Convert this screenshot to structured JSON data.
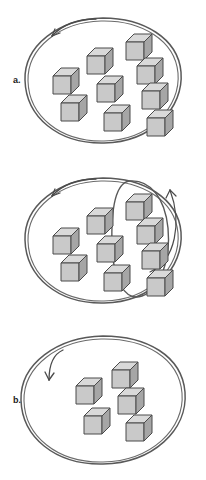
{
  "figure": {
    "background_color": "#ffffff",
    "outline_color": "#4d4d4d",
    "label_color": "#1a1a1a"
  },
  "cube_style": {
    "top_face_color": "#d8d8d8",
    "front_face_color": "#c9c9c9",
    "side_face_color": "#a8a8a8",
    "edge_color": "#4a4a4a"
  },
  "panels": [
    {
      "id": "a",
      "label": "a.",
      "enclosure": "hand-drawn-rounded-circle",
      "arrow": "curved-arrow-top-left-pointing-into-enclosure",
      "cube_count": 9,
      "inner_enclosure": false,
      "cubes": [
        {
          "x": 126,
          "y": 34,
          "size": 26
        },
        {
          "x": 87,
          "y": 48,
          "size": 25
        },
        {
          "x": 137,
          "y": 58,
          "size": 25
        },
        {
          "x": 53,
          "y": 68,
          "size": 25
        },
        {
          "x": 97,
          "y": 76,
          "size": 26
        },
        {
          "x": 142,
          "y": 83,
          "size": 25
        },
        {
          "x": 61,
          "y": 95,
          "size": 25
        },
        {
          "x": 104,
          "y": 105,
          "size": 26
        },
        {
          "x": 147,
          "y": 110,
          "size": 25
        }
      ]
    },
    {
      "id": "b",
      "label": "b.",
      "enclosure": "hand-drawn-rounded-circle",
      "arrow": "curved-arrow-top-left-pointing-into-enclosure",
      "inner_enclosure": true,
      "inner_enclosure_shape": "tilted-ellipse-right-side",
      "inner_arrow": "curved-arrow-pointing-up-right-from-inner-ellipse",
      "cube_count": 9,
      "cubes_inside_inner": 4,
      "cubes_outside_inner": 5,
      "cubes": [
        {
          "x": 126,
          "y": 34,
          "size": 26,
          "in_inner": true
        },
        {
          "x": 87,
          "y": 48,
          "size": 25,
          "in_inner": false
        },
        {
          "x": 137,
          "y": 58,
          "size": 25,
          "in_inner": true
        },
        {
          "x": 53,
          "y": 68,
          "size": 25,
          "in_inner": false
        },
        {
          "x": 97,
          "y": 76,
          "size": 26,
          "in_inner": false
        },
        {
          "x": 142,
          "y": 83,
          "size": 25,
          "in_inner": true
        },
        {
          "x": 61,
          "y": 95,
          "size": 25,
          "in_inner": false
        },
        {
          "x": 104,
          "y": 105,
          "size": 26,
          "in_inner": false
        },
        {
          "x": 147,
          "y": 110,
          "size": 25,
          "in_inner": true
        }
      ]
    },
    {
      "id": "c",
      "label": "c.",
      "enclosure": "hand-drawn-rounded-circle",
      "arrow": "curved-arrow-left-pointing-into-enclosure",
      "inner_enclosure": false,
      "cube_count": 5,
      "cubes": [
        {
          "x": 112,
          "y": 42,
          "size": 26
        },
        {
          "x": 76,
          "y": 58,
          "size": 26
        },
        {
          "x": 118,
          "y": 68,
          "size": 26
        },
        {
          "x": 84,
          "y": 88,
          "size": 26
        },
        {
          "x": 126,
          "y": 95,
          "size": 26
        }
      ]
    }
  ]
}
